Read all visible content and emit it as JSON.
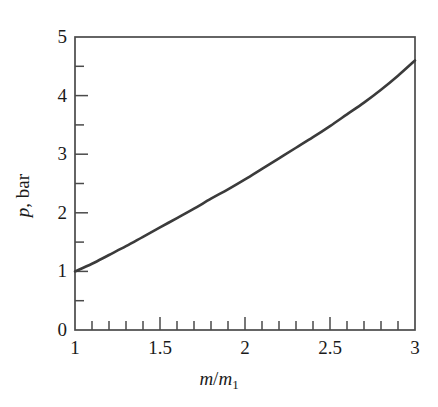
{
  "chart_data": {
    "type": "line",
    "title": "",
    "xlabel": "m/m1",
    "xlabel_parts": {
      "num": "m",
      "slash": "/",
      "den": "m",
      "sub": "1"
    },
    "ylabel": "p, bar",
    "ylabel_parts": {
      "symbol": "p",
      "rest": ", bar"
    },
    "xlim": [
      1,
      3
    ],
    "ylim": [
      0,
      5
    ],
    "grid": false,
    "legend": null,
    "xticks": [
      1,
      1.5,
      2,
      2.5,
      3
    ],
    "xtick_labels": [
      "1",
      "1.5",
      "2",
      "2.5",
      "3"
    ],
    "xminor_step": 0.1,
    "yticks": [
      0,
      1,
      2,
      3,
      4,
      5
    ],
    "ytick_labels": [
      "0",
      "1",
      "2",
      "3",
      "4",
      "5"
    ],
    "yminor_step": 0.5,
    "line_color": "#3b3b3b",
    "axis_color": "#4a4a4a",
    "line_width": 2.6,
    "x": [
      1.0,
      1.1,
      1.2,
      1.3,
      1.4,
      1.5,
      1.6,
      1.7,
      1.8,
      1.9,
      2.0,
      2.1,
      2.2,
      2.3,
      2.4,
      2.5,
      2.6,
      2.7,
      2.8,
      2.9,
      3.0
    ],
    "values": [
      1.0,
      1.13,
      1.28,
      1.43,
      1.59,
      1.75,
      1.91,
      2.07,
      2.24,
      2.4,
      2.57,
      2.75,
      2.93,
      3.11,
      3.29,
      3.48,
      3.68,
      3.88,
      4.1,
      4.34,
      4.6
    ],
    "series": [
      {
        "name": "p",
        "values": [
          1.0,
          1.13,
          1.28,
          1.43,
          1.59,
          1.75,
          1.91,
          2.07,
          2.24,
          2.4,
          2.57,
          2.75,
          2.93,
          3.11,
          3.29,
          3.48,
          3.68,
          3.88,
          4.1,
          4.34,
          4.6
        ]
      }
    ]
  },
  "plot_box": {
    "left": 75,
    "top": 37,
    "right": 415,
    "bottom": 330
  }
}
